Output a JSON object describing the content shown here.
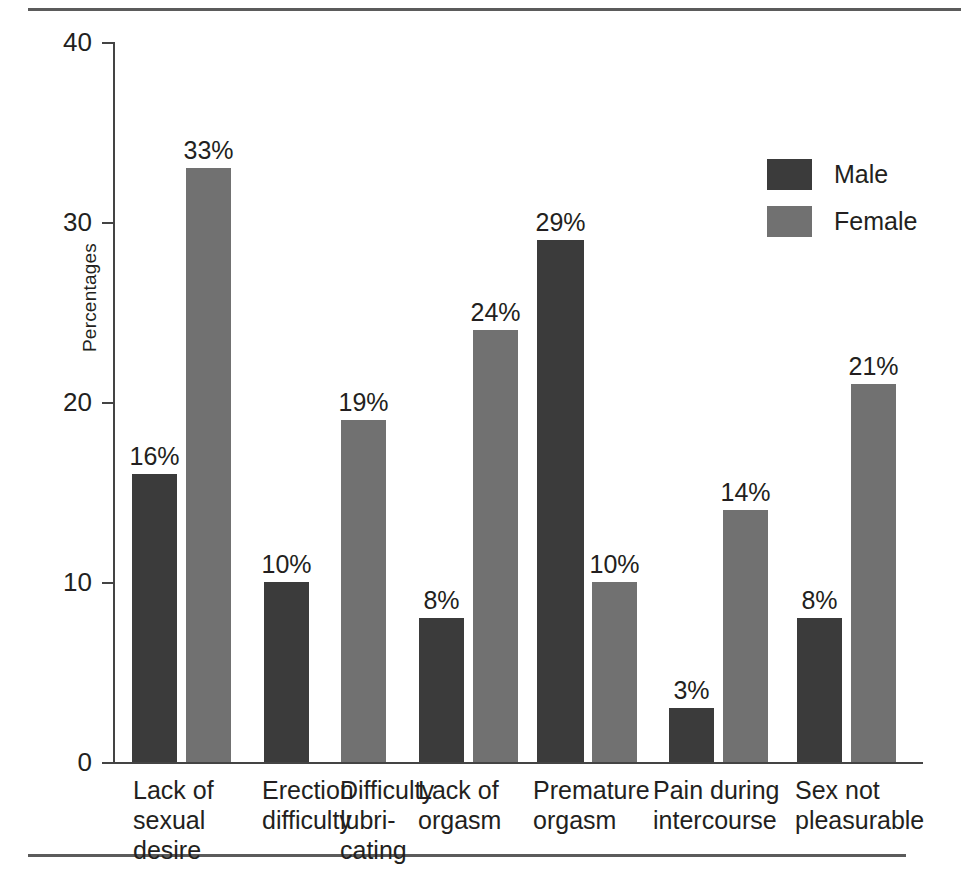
{
  "figure": {
    "y_axis_title": "Percentages",
    "y_ticks": [
      "40",
      "30",
      "20",
      "10",
      "0"
    ],
    "legend": [
      {
        "label": "Male",
        "color": "#3b3b3b",
        "key": "male"
      },
      {
        "label": "Female",
        "color": "#717171",
        "key": "female"
      }
    ]
  },
  "chart_data": {
    "type": "bar",
    "title": "",
    "subtitle": "",
    "xlabel": "",
    "ylabel": "Percentages",
    "ylim": [
      0,
      40
    ],
    "yticks": [
      0,
      10,
      20,
      30,
      40
    ],
    "grid": false,
    "legend_position": "top-right",
    "value_label_suffix": "%",
    "categories": [
      "Lack of\nsexual\ndesire",
      "Erection\ndifficulty",
      "Difficulty\nlubri-\ncating",
      "Lack of\norgasm",
      "Premature\norgasm",
      "Pain during\nintercourse",
      "Sex not\npleasurable"
    ],
    "series": [
      {
        "name": "Male",
        "color": "#3b3b3b",
        "values": [
          16,
          10,
          null,
          8,
          29,
          3,
          8
        ]
      },
      {
        "name": "Female",
        "color": "#717171",
        "values": [
          33,
          null,
          19,
          24,
          10,
          14,
          21
        ]
      }
    ],
    "bars": [
      {
        "group": 0,
        "series": "Male",
        "value": 16,
        "label": "16%",
        "x": 132,
        "width": 45
      },
      {
        "group": 0,
        "series": "Female",
        "value": 33,
        "label": "33%",
        "x": 186,
        "width": 45
      },
      {
        "group": 1,
        "series": "Male",
        "value": 10,
        "label": "10%",
        "x": 264,
        "width": 45
      },
      {
        "group": 2,
        "series": "Female",
        "value": 19,
        "label": "19%",
        "x": 341,
        "width": 45
      },
      {
        "group": 3,
        "series": "Male",
        "value": 8,
        "label": "8%",
        "x": 419,
        "width": 45
      },
      {
        "group": 3,
        "series": "Female",
        "value": 24,
        "label": "24%",
        "x": 473,
        "width": 45
      },
      {
        "group": 4,
        "series": "Male",
        "value": 29,
        "label": "29%",
        "x": 537,
        "width": 47
      },
      {
        "group": 4,
        "series": "Female",
        "value": 10,
        "label": "10%",
        "x": 592,
        "width": 45
      },
      {
        "group": 5,
        "series": "Male",
        "value": 3,
        "label": "3%",
        "x": 669,
        "width": 45
      },
      {
        "group": 5,
        "series": "Female",
        "value": 14,
        "label": "14%",
        "x": 723,
        "width": 45
      },
      {
        "group": 6,
        "series": "Male",
        "value": 8,
        "label": "8%",
        "x": 797,
        "width": 45
      },
      {
        "group": 6,
        "series": "Female",
        "value": 21,
        "label": "21%",
        "x": 851,
        "width": 45
      }
    ],
    "category_label_positions": [
      133,
      262,
      340,
      418,
      533,
      653,
      795
    ]
  }
}
